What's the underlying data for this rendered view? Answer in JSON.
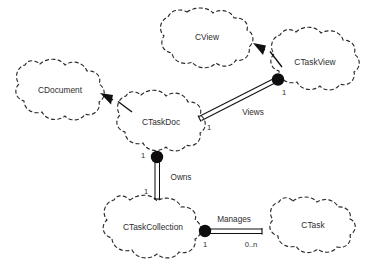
{
  "diagram": {
    "background_color": "#ffffff",
    "line_color": "#111111",
    "text_color": "#2e2e2e",
    "classes": [
      {
        "id": "cview",
        "name": "CView"
      },
      {
        "id": "ctaskview",
        "name": "CTaskView"
      },
      {
        "id": "cdocument",
        "name": "CDocument"
      },
      {
        "id": "ctaskdoc",
        "name": "CTaskDoc"
      },
      {
        "id": "ctaskcollection",
        "name": "CTaskCollection"
      },
      {
        "id": "ctask",
        "name": "CTask"
      }
    ],
    "associations": [
      {
        "id": "views",
        "label": "Views",
        "from": "CTaskDoc",
        "to": "CTaskView",
        "from_multiplicity": "1",
        "to_multiplicity": "1",
        "kind": "aggregation"
      },
      {
        "id": "owns",
        "label": "Owns",
        "from": "CTaskDoc",
        "to": "CTaskCollection",
        "from_multiplicity": "1",
        "to_multiplicity": "1",
        "kind": "aggregation"
      },
      {
        "id": "manages",
        "label": "Manages",
        "from": "CTaskCollection",
        "to": "CTask",
        "from_multiplicity": "1",
        "to_multiplicity": "0..n",
        "kind": "aggregation"
      }
    ],
    "inheritances": [
      {
        "id": "ctaskview-cview",
        "from": "CTaskView",
        "to": "CView"
      },
      {
        "id": "ctaskdoc-cdocument",
        "from": "CTaskDoc",
        "to": "CDocument"
      }
    ]
  }
}
